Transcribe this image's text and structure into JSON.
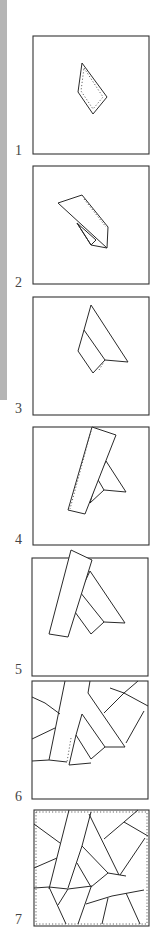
{
  "steps": [
    {
      "number": "1",
      "description": "Center patch placed on foundation square"
    },
    {
      "number": "2",
      "description": "Second patch sewn right side down and flipped"
    },
    {
      "number": "3",
      "description": "Second patch pressed open"
    },
    {
      "number": "4",
      "description": "Third patch (long strip) sewn along edge"
    },
    {
      "number": "5",
      "description": "Third patch pressed open"
    },
    {
      "number": "6",
      "description": "Additional patches added around the center"
    },
    {
      "number": "7",
      "description": "Foundation fully covered, edges stay-stitched"
    }
  ]
}
